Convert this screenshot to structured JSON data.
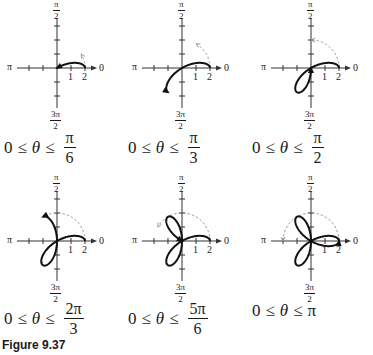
{
  "figure": {
    "label": "Figure 9.37",
    "curve": "r = 2cos(3θ)",
    "axis_labels": {
      "right": "0",
      "left": "π",
      "top_num": "π",
      "top_den": "2",
      "bottom_num": "3π",
      "bottom_den": "2",
      "tick1": "1",
      "tick2": "2"
    },
    "colors": {
      "curve": "#111111",
      "axis": "#333333",
      "dashed_arc": "#9a9a9a"
    },
    "scale_px_per_unit": 14
  },
  "panels": [
    {
      "id": "p1",
      "caption": {
        "lhs": "0",
        "rel1": "≤",
        "var": "θ",
        "rel2": "≤",
        "num": "π",
        "den": "6",
        "whole": ""
      },
      "theta_end_over_pi": 0.16667
    },
    {
      "id": "p2",
      "caption": {
        "lhs": "0",
        "rel1": "≤",
        "var": "θ",
        "rel2": "≤",
        "num": "π",
        "den": "3",
        "whole": ""
      },
      "theta_end_over_pi": 0.33333
    },
    {
      "id": "p3",
      "caption": {
        "lhs": "0",
        "rel1": "≤",
        "var": "θ",
        "rel2": "≤",
        "num": "π",
        "den": "2",
        "whole": ""
      },
      "theta_end_over_pi": 0.5
    },
    {
      "id": "p4",
      "caption": {
        "lhs": "0",
        "rel1": "≤",
        "var": "θ",
        "rel2": "≤",
        "num": "2π",
        "den": "3",
        "whole": ""
      },
      "theta_end_over_pi": 0.66667
    },
    {
      "id": "p5",
      "caption": {
        "lhs": "0",
        "rel1": "≤",
        "var": "θ",
        "rel2": "≤",
        "num": "5π",
        "den": "6",
        "whole": ""
      },
      "theta_end_over_pi": 0.83333
    },
    {
      "id": "p6",
      "caption": {
        "lhs": "0",
        "rel1": "≤",
        "var": "θ",
        "rel2": "≤",
        "num": "",
        "den": "",
        "whole": "π"
      },
      "theta_end_over_pi": 1.0
    }
  ]
}
